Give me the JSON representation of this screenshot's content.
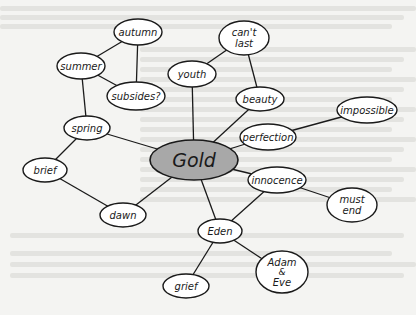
{
  "diagram": {
    "type": "mind-map",
    "colors": {
      "background": "#f4f4f2",
      "node_fill": "#ffffff",
      "central_fill": "#a8a8a8",
      "stroke": "#1a1a1a",
      "text": "#1a1a1a"
    },
    "central": {
      "id": "gold",
      "label": "Gold",
      "cx": 194,
      "cy": 160,
      "rx": 44,
      "ry": 20
    },
    "nodes": [
      {
        "id": "autumn",
        "lines": [
          "autumn"
        ],
        "cx": 138,
        "cy": 32,
        "rx": 24,
        "ry": 13
      },
      {
        "id": "summer",
        "lines": [
          "summer"
        ],
        "cx": 81,
        "cy": 66,
        "rx": 24,
        "ry": 13
      },
      {
        "id": "subsides",
        "lines": [
          "subsides?"
        ],
        "cx": 136,
        "cy": 96,
        "rx": 29,
        "ry": 14
      },
      {
        "id": "spring",
        "lines": [
          "spring"
        ],
        "cx": 87,
        "cy": 128,
        "rx": 23,
        "ry": 12
      },
      {
        "id": "brief",
        "lines": [
          "brief"
        ],
        "cx": 45,
        "cy": 170,
        "rx": 22,
        "ry": 12
      },
      {
        "id": "dawn",
        "lines": [
          "dawn"
        ],
        "cx": 123,
        "cy": 215,
        "rx": 23,
        "ry": 12
      },
      {
        "id": "youth",
        "lines": [
          "youth"
        ],
        "cx": 192,
        "cy": 74,
        "rx": 24,
        "ry": 13
      },
      {
        "id": "cant-last",
        "lines": [
          "can't",
          "last"
        ],
        "cx": 244,
        "cy": 38,
        "rx": 25,
        "ry": 17
      },
      {
        "id": "beauty",
        "lines": [
          "beauty"
        ],
        "cx": 260,
        "cy": 99,
        "rx": 24,
        "ry": 12
      },
      {
        "id": "perfection",
        "lines": [
          "perfection"
        ],
        "cx": 268,
        "cy": 137,
        "rx": 28,
        "ry": 13
      },
      {
        "id": "impossible",
        "lines": [
          "impossible"
        ],
        "cx": 367,
        "cy": 110,
        "rx": 30,
        "ry": 13
      },
      {
        "id": "innocence",
        "lines": [
          "innocence"
        ],
        "cx": 277,
        "cy": 180,
        "rx": 29,
        "ry": 13
      },
      {
        "id": "must-end",
        "lines": [
          "must",
          "end"
        ],
        "cx": 352,
        "cy": 205,
        "rx": 25,
        "ry": 17
      },
      {
        "id": "eden",
        "lines": [
          "Eden"
        ],
        "cx": 220,
        "cy": 231,
        "rx": 22,
        "ry": 12
      },
      {
        "id": "adam-eve",
        "lines": [
          "Adam",
          "&",
          "Eve"
        ],
        "cx": 282,
        "cy": 272,
        "rx": 26,
        "ry": 21
      },
      {
        "id": "grief",
        "lines": [
          "grief"
        ],
        "cx": 186,
        "cy": 286,
        "rx": 23,
        "ry": 12
      }
    ],
    "edges": [
      [
        "autumn",
        "summer"
      ],
      [
        "autumn",
        "subsides"
      ],
      [
        "summer",
        "subsides"
      ],
      [
        "summer",
        "spring"
      ],
      [
        "spring",
        "gold"
      ],
      [
        "spring",
        "brief"
      ],
      [
        "brief",
        "dawn"
      ],
      [
        "dawn",
        "gold"
      ],
      [
        "youth",
        "cant-last"
      ],
      [
        "youth",
        "gold"
      ],
      [
        "cant-last",
        "beauty"
      ],
      [
        "beauty",
        "gold"
      ],
      [
        "perfection",
        "gold"
      ],
      [
        "perfection",
        "impossible"
      ],
      [
        "gold",
        "innocence"
      ],
      [
        "innocence",
        "must-end"
      ],
      [
        "innocence",
        "eden"
      ],
      [
        "gold",
        "eden"
      ],
      [
        "eden",
        "adam-eve"
      ],
      [
        "eden",
        "grief"
      ]
    ]
  }
}
